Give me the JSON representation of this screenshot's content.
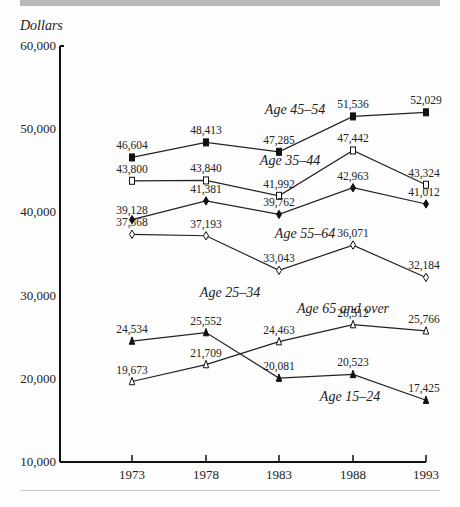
{
  "chart_data": {
    "type": "line",
    "title": "",
    "xlabel": "",
    "ylabel": "Dollars",
    "x": [
      "1973",
      "1978",
      "1983",
      "1988",
      "1993"
    ],
    "ylim": [
      10000,
      60000
    ],
    "yticks": [
      "10,000",
      "20,000",
      "30,000",
      "40,000",
      "50,000",
      "60,000"
    ],
    "grid": false,
    "legend": "inline labels",
    "series": [
      {
        "name": "Age 45–54",
        "marker": "filled-square",
        "values": [
          46604,
          48413,
          47285,
          51536,
          52029
        ],
        "labels": [
          "46,604",
          "48,413",
          "47,285",
          "51,536",
          "52,029"
        ]
      },
      {
        "name": "Age 35–44",
        "marker": "open-square",
        "values": [
          43800,
          43840,
          41992,
          47442,
          43324
        ],
        "labels": [
          "43,800",
          "43,840",
          "41,992",
          "47,442",
          "43,324"
        ]
      },
      {
        "name": "Age 55–64",
        "marker": "filled-diamond",
        "values": [
          39128,
          41381,
          39762,
          42963,
          41012
        ],
        "labels": [
          "39,128",
          "41,381",
          "39,762",
          "42,963",
          "41,012"
        ]
      },
      {
        "name": "Age 25–34",
        "marker": "open-diamond",
        "values": [
          37368,
          37193,
          33043,
          36071,
          32184
        ],
        "labels": [
          "37,368",
          "37,193",
          "33,043",
          "36,071",
          "32,184"
        ]
      },
      {
        "name": "Age 65 and over",
        "marker": "open-triangle",
        "values": [
          19673,
          21709,
          24463,
          26512,
          25766
        ],
        "labels": [
          "19,673",
          "21,709",
          "24,463",
          "26,512",
          "25,766"
        ]
      },
      {
        "name": "Age 15–24",
        "marker": "filled-triangle",
        "values": [
          24534,
          25552,
          20081,
          20523,
          17425
        ],
        "labels": [
          "24,534",
          "25,552",
          "20,081",
          "20,523",
          "17,425"
        ]
      }
    ]
  }
}
